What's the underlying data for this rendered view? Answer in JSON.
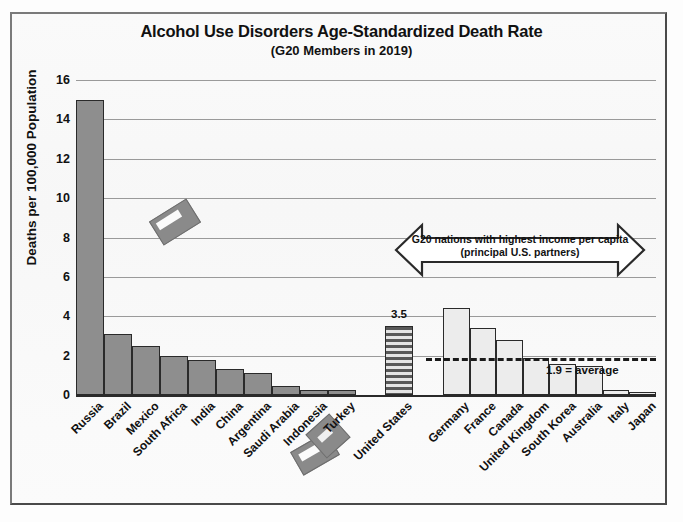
{
  "chart_data": {
    "type": "bar",
    "title": "Alcohol Use Disorders Age-Standardized Death Rate",
    "subtitle": "(G20 Members in 2019)",
    "xlabel": "",
    "ylabel": "Deaths per 100,000 Population",
    "ylim": [
      0,
      16
    ],
    "yticks": [
      0,
      2,
      4,
      6,
      8,
      10,
      12,
      14,
      16
    ],
    "grid": true,
    "legend": "none",
    "categories": [
      "Russia",
      "Brazil",
      "Mexico",
      "South Africa",
      "India",
      "China",
      "Argentina",
      "Saudi Arabia",
      "Indonesia",
      "Turkey",
      "United States",
      "Germany",
      "France",
      "Canada",
      "United Kingdom",
      "South Korea",
      "Australia",
      "Italy",
      "Japan"
    ],
    "values": [
      15.0,
      3.1,
      2.5,
      2.0,
      1.8,
      1.3,
      1.1,
      0.45,
      0.25,
      0.25,
      3.5,
      4.4,
      3.4,
      2.8,
      1.9,
      1.6,
      1.45,
      0.25,
      0.15
    ],
    "data_labels": {
      "United States": "3.5"
    },
    "reference_line": {
      "value": 1.9,
      "label": "1.9 = average",
      "style": "dashed"
    },
    "annotations": [
      {
        "type": "double-headed-arrow",
        "line1": "G20 nations with highest income per capita",
        "line2": "(principal U.S. partners)"
      }
    ],
    "colors": {
      "bar_dark": "#8e8e8e",
      "bar_light": "#ececec",
      "bar_highlight": "#585858",
      "outline": "#2a2a2a",
      "gridline": "#9a9a9a",
      "text": "#111111"
    }
  }
}
